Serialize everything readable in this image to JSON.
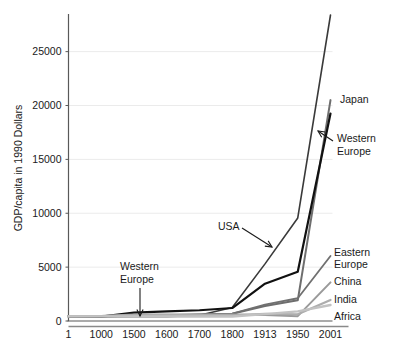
{
  "chart_data": {
    "type": "line",
    "title": "",
    "xlabel": "",
    "ylabel": "GDP/capita in 1990 Dollars",
    "categories": [
      "1",
      "1000",
      "1500",
      "1600",
      "1700",
      "1800",
      "1913",
      "1950",
      "2001"
    ],
    "yticks": [
      0,
      5000,
      10000,
      15000,
      20000,
      25000
    ],
    "ylim": [
      0,
      28400
    ],
    "grid": true,
    "legend_position": "right-inline-labels",
    "series": [
      {
        "name": "USA",
        "color": "#3a3a3a",
        "width": 1.6,
        "values": [
          400,
          400,
          400,
          400,
          527,
          1257,
          5301,
          9561,
          28400
        ],
        "clipped_top": true
      },
      {
        "name": "Japan",
        "color": "#6e6e6e",
        "width": 2.0,
        "values": [
          400,
          425,
          500,
          520,
          570,
          669,
          1387,
          1921,
          20500
        ]
      },
      {
        "name": "Western Europe",
        "color": "#111111",
        "width": 2.2,
        "values": [
          450,
          400,
          771,
          889,
          997,
          1204,
          3458,
          4579,
          19256
        ]
      },
      {
        "name": "Eastern Europe",
        "color": "#707070",
        "width": 1.8,
        "values": [
          400,
          400,
          496,
          548,
          606,
          683,
          1527,
          2111,
          6027
        ]
      },
      {
        "name": "China",
        "color": "#9a9a9a",
        "width": 2.0,
        "values": [
          450,
          466,
          600,
          600,
          600,
          600,
          552,
          448,
          3583
        ]
      },
      {
        "name": "India",
        "color": "#adadad",
        "width": 2.2,
        "values": [
          450,
          450,
          550,
          550,
          550,
          533,
          673,
          619,
          1957
        ]
      },
      {
        "name": "Africa",
        "color": "#c2c2c2",
        "width": 2.4,
        "values": [
          430,
          425,
          414,
          422,
          421,
          420,
          637,
          894,
          1489
        ]
      }
    ],
    "series_labels": [
      {
        "text": "Japan",
        "x": 340,
        "y": 103
      },
      {
        "text": "Eastern",
        "x": 334,
        "y": 256
      },
      {
        "text": "Europe",
        "x": 334,
        "y": 268
      },
      {
        "text": "China",
        "x": 334,
        "y": 285
      },
      {
        "text": "India",
        "x": 334,
        "y": 303
      },
      {
        "text": "Africa",
        "x": 334,
        "y": 320
      }
    ],
    "annotations": [
      {
        "label": "USA",
        "lines": [
          "USA"
        ],
        "text_x": 218,
        "text_y": 230,
        "arrow": {
          "x1": 242,
          "y1": 228,
          "x2": 272,
          "y2": 247
        }
      },
      {
        "label": "Western Europe",
        "lines": [
          "Western",
          "Europe"
        ],
        "text_x": 337,
        "text_y": 142,
        "arrow": {
          "x1": 333,
          "y1": 141,
          "x2": 318,
          "y2": 131
        }
      },
      {
        "label": "Western Europe",
        "lines": [
          "Western",
          "Europe"
        ],
        "text_x": 120,
        "text_y": 270,
        "arrow": {
          "x1": 140,
          "y1": 288,
          "x2": 140,
          "y2": 316
        }
      }
    ]
  },
  "colors": {
    "grid": "#ebebeb",
    "axis": "#595959",
    "baseline": "#8a8a8a",
    "text": "#1a1a1a"
  }
}
